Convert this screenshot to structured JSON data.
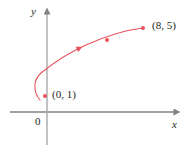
{
  "figure": {
    "type": "parametric-curve-plot",
    "background_color": "#ffffff"
  },
  "axes": {
    "x_label": "x",
    "y_label": "y",
    "origin_label": "0",
    "axis_color": "#808285",
    "x_axis": {
      "from_px": [
        10,
        112
      ],
      "to_px": [
        178,
        112
      ],
      "arrow": "right"
    },
    "y_axis": {
      "from_px": [
        47,
        145
      ],
      "to_px": [
        47,
        10
      ],
      "arrow": "up"
    }
  },
  "curve": {
    "color": "#e8505b",
    "stroke_width": 1.1,
    "direction_arrow": {
      "at_px": [
        78,
        45
      ],
      "points": "up-right"
    },
    "path": "M 40 100 C 33 92, 33 80, 41 73 C 52 64, 66 54, 86 45 C 106 36, 126 30, 143 28"
  },
  "points": [
    {
      "name": "start-point",
      "label": "(0, 1)",
      "px": [
        45,
        96
      ],
      "color": "#e8505b"
    },
    {
      "name": "mid-point",
      "label": "",
      "px": [
        107,
        40
      ],
      "color": "#e8505b"
    },
    {
      "name": "end-point",
      "label": "(8, 5)",
      "px": [
        143,
        28
      ],
      "color": "#e8505b"
    }
  ],
  "chart_data": {
    "type": "line",
    "title": "",
    "xlabel": "x",
    "ylabel": "y",
    "grid": false,
    "legend": null,
    "annotations": [
      {
        "text": "(0, 1)",
        "x": 0,
        "y": 1
      },
      {
        "text": "(8, 5)",
        "x": 8,
        "y": 5
      },
      {
        "text": "0",
        "x": 0,
        "y": 0
      }
    ],
    "series": [
      {
        "name": "curve",
        "color": "#e8505b",
        "x": [
          0,
          0.0,
          0.3,
          1.2,
          2.6,
          4.2,
          6.0,
          8.0
        ],
        "y": [
          1,
          1.6,
          2.3,
          2.9,
          3.5,
          4.1,
          4.6,
          5.0
        ]
      }
    ]
  }
}
